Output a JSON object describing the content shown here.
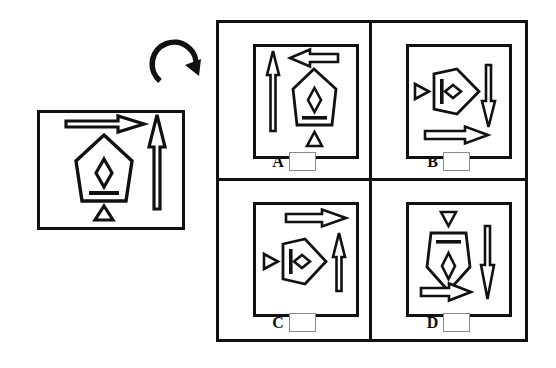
{
  "task": {
    "type": "mental-rotation-multiple-choice",
    "title": "",
    "instruction_icon": "clockwise-rotation-arrow-icon",
    "stroke_color": "#111111",
    "background_color": "#ffffff",
    "checkbox_border_color": "#8a8a8a"
  },
  "stimulus": {
    "label": "",
    "elements": [
      {
        "name": "right-arrow",
        "icon": "arrow-right-icon",
        "direction": "right"
      },
      {
        "name": "pentagon-shape",
        "icon": "pentagon-icon",
        "orientation": "point-up",
        "inner_marks": [
          "diamond",
          "bar"
        ]
      },
      {
        "name": "small-triangle",
        "icon": "triangle-up-icon",
        "direction": "up"
      },
      {
        "name": "tall-up-arrow",
        "icon": "arrow-up-icon",
        "direction": "up"
      }
    ]
  },
  "answers": {
    "options": [
      {
        "letter": "A",
        "checkbox_value": "",
        "elements": [
          {
            "name": "tall-up-arrow",
            "icon": "arrow-up-icon",
            "direction": "up"
          },
          {
            "name": "left-arrow",
            "icon": "arrow-left-icon",
            "direction": "left"
          },
          {
            "name": "pentagon-shape",
            "icon": "pentagon-icon",
            "orientation": "point-up",
            "inner_marks": [
              "diamond",
              "bar"
            ]
          },
          {
            "name": "small-triangle",
            "icon": "triangle-up-icon",
            "direction": "up"
          }
        ]
      },
      {
        "letter": "B",
        "checkbox_value": "",
        "elements": [
          {
            "name": "small-triangle",
            "icon": "triangle-right-icon",
            "direction": "right"
          },
          {
            "name": "pentagon-shape",
            "icon": "pentagon-icon",
            "orientation": "point-right",
            "inner_marks": [
              "diamond",
              "bar"
            ]
          },
          {
            "name": "tall-down-arrow",
            "icon": "arrow-down-icon",
            "direction": "down"
          },
          {
            "name": "right-arrow",
            "icon": "arrow-right-icon",
            "direction": "right"
          }
        ]
      },
      {
        "letter": "C",
        "checkbox_value": "",
        "elements": [
          {
            "name": "right-arrow",
            "icon": "arrow-right-icon",
            "direction": "right"
          },
          {
            "name": "small-triangle",
            "icon": "triangle-right-icon",
            "direction": "right"
          },
          {
            "name": "pentagon-shape",
            "icon": "pentagon-icon",
            "orientation": "point-right",
            "inner_marks": [
              "diamond",
              "bar"
            ]
          },
          {
            "name": "tall-up-arrow",
            "icon": "arrow-up-icon",
            "direction": "up"
          }
        ]
      },
      {
        "letter": "D",
        "checkbox_value": "",
        "elements": [
          {
            "name": "small-triangle",
            "icon": "triangle-down-icon",
            "direction": "down"
          },
          {
            "name": "pentagon-shape",
            "icon": "pentagon-icon",
            "orientation": "point-down",
            "inner_marks": [
              "bar",
              "diamond"
            ]
          },
          {
            "name": "tall-down-arrow",
            "icon": "arrow-down-icon",
            "direction": "down"
          },
          {
            "name": "right-arrow",
            "icon": "arrow-right-icon",
            "direction": "right"
          }
        ]
      }
    ]
  }
}
